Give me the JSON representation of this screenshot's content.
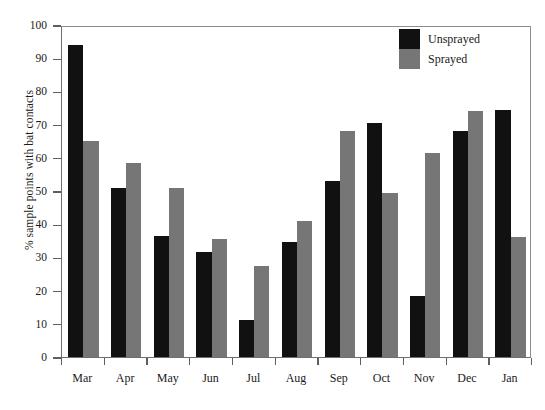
{
  "chart_data": {
    "type": "bar",
    "title": "",
    "subtitle": "",
    "xlabel": "",
    "ylabel": "% sample points with bat contacts",
    "ylim": [
      0,
      100
    ],
    "ytick_step": 10,
    "ytick_labels": [
      "100",
      "90",
      "80",
      "70",
      "60",
      "50",
      "40",
      "30",
      "20",
      "10",
      "0"
    ],
    "ytick_values": [
      100,
      90,
      80,
      70,
      60,
      50,
      40,
      30,
      20,
      10,
      0
    ],
    "grid": false,
    "legend_position": "top-right",
    "categories": [
      "Mar",
      "Apr",
      "May",
      "Jun",
      "Jul",
      "Aug",
      "Sep",
      "Oct",
      "Nov",
      "Dec",
      "Jan"
    ],
    "series": [
      {
        "name": "Unsprayed",
        "color": "#111111",
        "values": [
          94,
          51,
          36.5,
          31.5,
          11,
          34.5,
          53,
          70.5,
          18.5,
          68,
          74.5
        ]
      },
      {
        "name": "Sprayed",
        "color": "#767676",
        "values": [
          65,
          58.5,
          51,
          35.5,
          27.5,
          41,
          68,
          49.5,
          61.5,
          74,
          36
        ]
      }
    ],
    "legend": [
      {
        "label": "Unsprayed",
        "swatch": "black-swatch"
      },
      {
        "label": "Sprayed",
        "swatch": "gray-swatch"
      }
    ]
  }
}
